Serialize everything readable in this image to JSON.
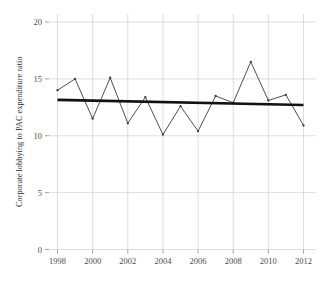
{
  "chart_data": {
    "type": "line",
    "title": "",
    "subtitle": "",
    "xlabel": "",
    "ylabel": "Corporate lobbying to PAC expenditure ratio",
    "xlim": [
      1997.6,
      2012.6
    ],
    "ylim": [
      0,
      20
    ],
    "grid": true,
    "legend_position": "none",
    "x": [
      1998,
      1999,
      2000,
      2001,
      2002,
      2003,
      2004,
      2005,
      2006,
      2007,
      2008,
      2009,
      2010,
      2011,
      2012
    ],
    "xtick_values": [
      1998,
      2000,
      2002,
      2004,
      2006,
      2008,
      2010,
      2012
    ],
    "xtick_labels": [
      "1998",
      "2000",
      "2002",
      "2004",
      "2006",
      "2008",
      "2010",
      "2012"
    ],
    "ytick_values": [
      0,
      5,
      10,
      15,
      20
    ],
    "ytick_labels": [
      "0",
      "5",
      "10",
      "15",
      "20"
    ],
    "series": [
      {
        "name": "Corporate lobbying to PAC expenditure ratio",
        "kind": "line-with-markers",
        "color": "#3a3a3a",
        "values": [
          14.0,
          15.0,
          11.5,
          15.1,
          11.1,
          13.4,
          10.1,
          12.6,
          10.4,
          13.5,
          12.9,
          16.5,
          13.1,
          13.6,
          10.9
        ]
      },
      {
        "name": "Linear trend",
        "kind": "trend-line",
        "color": "#111111",
        "endpoints": [
          {
            "x": 1998,
            "y": 13.15
          },
          {
            "x": 2012,
            "y": 12.7
          }
        ]
      }
    ],
    "colors": {
      "grid": "#cfcfcf",
      "axis_text": "#4a4a4a",
      "data_line": "#3a3a3a",
      "trend_line": "#111111",
      "background": "#ffffff"
    }
  }
}
